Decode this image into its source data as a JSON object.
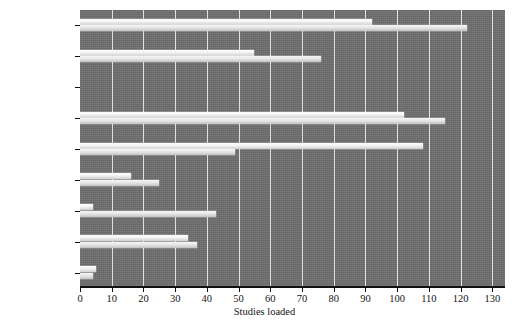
{
  "chart_data": {
    "type": "bar",
    "orientation": "horizontal",
    "title": "",
    "xlabel": "Studies loaded",
    "ylabel": "",
    "xlim": [
      0,
      134
    ],
    "xticks": [
      0,
      10,
      20,
      30,
      40,
      50,
      60,
      70,
      80,
      90,
      100,
      110,
      120,
      130
    ],
    "categories": [
      "pac00099",
      "pac00098",
      "pac00097",
      "pac00094",
      "pac00093",
      "pac00083",
      "pac00082",
      "pac00081",
      "pac00020"
    ],
    "series": [
      {
        "name": "series-a",
        "values": [
          92,
          55,
          0,
          102,
          108,
          16,
          4,
          34,
          5
        ]
      },
      {
        "name": "series-b",
        "values": [
          122,
          76,
          0,
          115,
          49,
          25,
          43,
          37,
          4
        ]
      }
    ],
    "grid": true,
    "grid_axis": "x",
    "legend": "none",
    "colors": {
      "plot_background": "#6e6e6e",
      "figure_background": "#ffffff",
      "gridline": "#e8e8e8",
      "bar_a": "#ffffff",
      "bar_b": "#e4e4e4",
      "axis": "#111111",
      "text": "#141414"
    }
  }
}
